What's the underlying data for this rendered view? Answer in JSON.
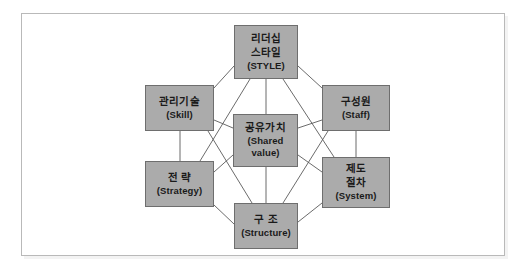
{
  "diagram": {
    "colors": {
      "node_fill": "#ababab",
      "node_border": "#6e6e6e",
      "connector": "#5a5a5a",
      "frame_border": "#b9b9b9",
      "background": "#ffffff"
    },
    "nodes": [
      {
        "id": "style",
        "position": "top",
        "ko_line1": "리더십",
        "ko_line2": "스타일",
        "en": "(STYLE)"
      },
      {
        "id": "skill",
        "position": "top-left",
        "ko_line1": "관리기술",
        "ko_line2": "",
        "en": "(Skill)"
      },
      {
        "id": "staff",
        "position": "top-right",
        "ko_line1": "구성원",
        "ko_line2": "",
        "en": "(Staff)"
      },
      {
        "id": "shared",
        "position": "center",
        "ko_line1": "공유가치",
        "ko_line2": "",
        "en_line1": "(Shared",
        "en_line2": "value)"
      },
      {
        "id": "strategy",
        "position": "bottom-left",
        "ko_line1": "전 략",
        "ko_line2": "",
        "en": "(Strategy)"
      },
      {
        "id": "system",
        "position": "bottom-right",
        "ko_line1": "제도",
        "ko_line2": "절차",
        "en": "(System)"
      },
      {
        "id": "structure",
        "position": "bottom",
        "ko_line1": "구 조",
        "ko_line2": "",
        "en": "(Structure)"
      }
    ],
    "edges": [
      [
        "style",
        "skill"
      ],
      [
        "style",
        "staff"
      ],
      [
        "style",
        "shared"
      ],
      [
        "style",
        "strategy"
      ],
      [
        "style",
        "system"
      ],
      [
        "skill",
        "staff"
      ],
      [
        "skill",
        "shared"
      ],
      [
        "skill",
        "strategy"
      ],
      [
        "skill",
        "structure"
      ],
      [
        "staff",
        "shared"
      ],
      [
        "staff",
        "system"
      ],
      [
        "staff",
        "structure"
      ],
      [
        "shared",
        "strategy"
      ],
      [
        "shared",
        "system"
      ],
      [
        "shared",
        "structure"
      ],
      [
        "strategy",
        "structure"
      ],
      [
        "system",
        "structure"
      ]
    ]
  }
}
